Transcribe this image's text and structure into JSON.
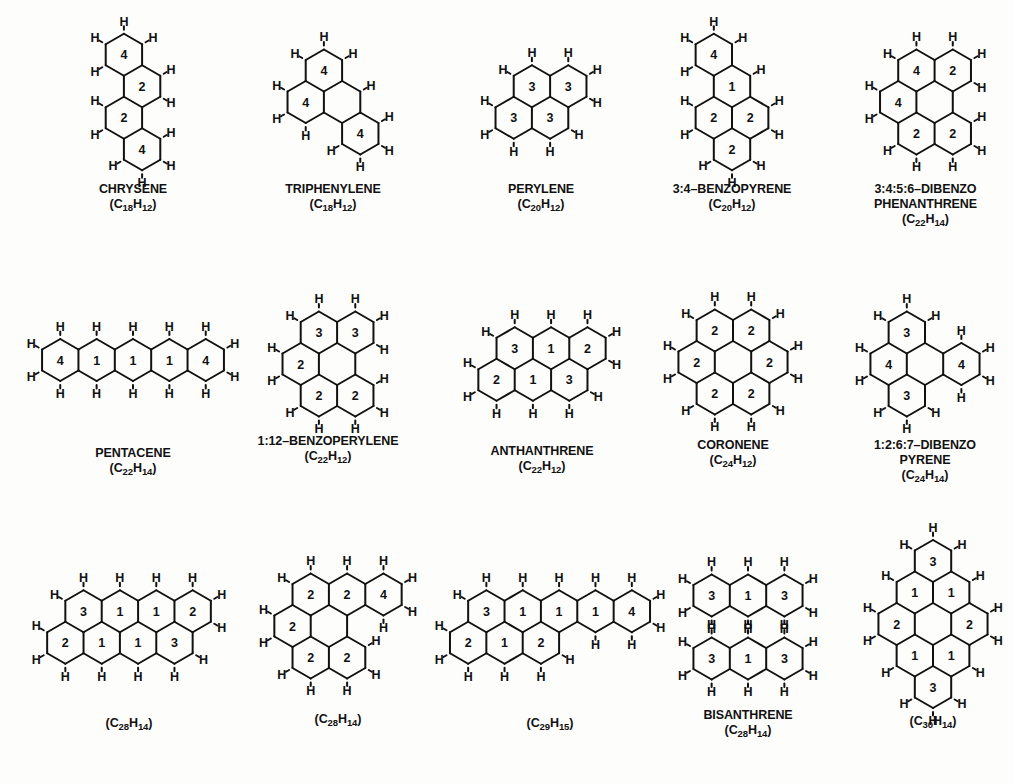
{
  "figure": {
    "type": "chemical-structure-grid",
    "rows": 3,
    "columns": 5
  },
  "molecules": [
    {
      "id": "chrysene",
      "name": "CHRYSENE",
      "formula_c": "18",
      "formula_h": "12",
      "rings": [
        {
          "label": "4",
          "cx": 0,
          "cy": 2
        },
        {
          "label": "2",
          "cx": 1,
          "cy": 1
        },
        {
          "label": "2",
          "cx": 2,
          "cy": 1
        },
        {
          "label": "4",
          "cx": 3,
          "cy": 0
        }
      ],
      "hydrogens": 12
    },
    {
      "id": "triphenylene",
      "name": "TRIPHENYLENE",
      "formula_c": "18",
      "formula_h": "12",
      "rings": [
        {
          "label": "4",
          "cx": 0,
          "cy": 1
        },
        {
          "label": "4",
          "cx": 1,
          "cy": 0
        },
        {
          "label": "4",
          "cx": 1,
          "cy": 2
        }
      ],
      "hydrogens": 12
    },
    {
      "id": "perylene",
      "name": "PERYLENE",
      "formula_c": "20",
      "formula_h": "12",
      "rings": [
        {
          "label": "3",
          "cx": 0,
          "cy": 0
        },
        {
          "label": "3",
          "cx": 1,
          "cy": 0
        },
        {
          "label": "3",
          "cx": 0,
          "cy": 1
        },
        {
          "label": "3",
          "cx": 1,
          "cy": 1
        }
      ],
      "hydrogens": 12
    },
    {
      "id": "benzopyrene",
      "name": "3:4–BENZOPYRENE",
      "formula_c": "20",
      "formula_h": "12",
      "rings": [
        {
          "label": "4"
        },
        {
          "label": "1"
        },
        {
          "label": "2"
        },
        {
          "label": "2"
        },
        {
          "label": "2"
        }
      ],
      "hydrogens": 12
    },
    {
      "id": "dibenzophenanthrene",
      "name": "3:4:5:6–DIBENZO",
      "name_line2": "PHENANTHRENE",
      "formula_c": "22",
      "formula_h": "14",
      "rings": [
        {
          "label": "4"
        },
        {
          "label": "4"
        },
        {
          "label": "2"
        },
        {
          "label": "2"
        },
        {
          "label": "2"
        }
      ],
      "hydrogens": 14
    },
    {
      "id": "pentacene",
      "name": "PENTACENE",
      "formula_c": "22",
      "formula_h": "14",
      "rings": [
        {
          "label": "4"
        },
        {
          "label": "1"
        },
        {
          "label": "1"
        },
        {
          "label": "1"
        },
        {
          "label": "4"
        }
      ],
      "hydrogens": 14
    },
    {
      "id": "benzoperylene",
      "name": "1:12–BENZOPERYLENE",
      "formula_c": "22",
      "formula_h": "12",
      "rings": [
        {
          "label": "3"
        },
        {
          "label": "2"
        },
        {
          "label": "3"
        },
        {
          "label": "2"
        },
        {
          "label": "2"
        }
      ],
      "hydrogens": 12
    },
    {
      "id": "anthanthrene",
      "name": "ANTHANTHRENE",
      "formula_c": "22",
      "formula_h": "12",
      "rings": [
        {
          "label": "3"
        },
        {
          "label": "1"
        },
        {
          "label": "2"
        },
        {
          "label": "2"
        },
        {
          "label": "1"
        },
        {
          "label": "3"
        }
      ],
      "hydrogens": 12
    },
    {
      "id": "coronene",
      "name": "CORONENE",
      "formula_c": "24",
      "formula_h": "12",
      "rings": [
        {
          "label": "2"
        },
        {
          "label": "2"
        },
        {
          "label": "2"
        },
        {
          "label": "2"
        },
        {
          "label": "2"
        },
        {
          "label": "2"
        }
      ],
      "hydrogens": 12
    },
    {
      "id": "dibenzopyrene",
      "name": "1:2:6:7–DIBENZO",
      "name_line2": "PYRENE",
      "formula_c": "24",
      "formula_h": "14",
      "rings": [
        {
          "label": "3"
        },
        {
          "label": "4"
        },
        {
          "label": "4"
        },
        {
          "label": "3"
        }
      ],
      "hydrogens": 14
    },
    {
      "id": "c28h14-a",
      "name": "",
      "formula_c": "28",
      "formula_h": "14",
      "rings": [
        {
          "label": "3"
        },
        {
          "label": "1"
        },
        {
          "label": "1"
        },
        {
          "label": "2"
        },
        {
          "label": "2"
        },
        {
          "label": "1"
        },
        {
          "label": "1"
        },
        {
          "label": "3"
        }
      ],
      "hydrogens": 14
    },
    {
      "id": "c28h14-b",
      "name": "",
      "formula_c": "28",
      "formula_h": "14",
      "rings": [
        {
          "label": "2"
        },
        {
          "label": "2"
        },
        {
          "label": "2"
        },
        {
          "label": "2"
        },
        {
          "label": "2"
        },
        {
          "label": "4"
        }
      ],
      "hydrogens": 14
    },
    {
      "id": "c29h15",
      "name": "",
      "formula_c": "29",
      "formula_h": "15",
      "rings": [
        {
          "label": "3"
        },
        {
          "label": "1"
        },
        {
          "label": "1"
        },
        {
          "label": "1"
        },
        {
          "label": "4"
        },
        {
          "label": "2"
        },
        {
          "label": "1"
        },
        {
          "label": "2"
        }
      ],
      "hydrogens": 15
    },
    {
      "id": "bisanthrene",
      "name": "BISANTHRENE",
      "formula_c": "28",
      "formula_h": "14",
      "rings": [
        {
          "label": "3"
        },
        {
          "label": "1"
        },
        {
          "label": "3"
        },
        {
          "label": "3"
        },
        {
          "label": "1"
        },
        {
          "label": "3"
        }
      ],
      "hydrogens": 14
    },
    {
      "id": "c30h14",
      "name": "",
      "formula_c": "30",
      "formula_h": "14",
      "rings": [
        {
          "label": "3"
        },
        {
          "label": "1"
        },
        {
          "label": "1"
        },
        {
          "label": "2"
        },
        {
          "label": "2"
        },
        {
          "label": "1"
        },
        {
          "label": "1"
        },
        {
          "label": "3"
        }
      ],
      "hydrogens": 14
    }
  ],
  "labels": {
    "hydrogen": "H",
    "open_paren": "(",
    "close_paren": ")",
    "carbon_symbol": "C",
    "hydrogen_symbol": "H"
  },
  "colors": {
    "ink": "#111111",
    "background": "#fdfdfc"
  }
}
